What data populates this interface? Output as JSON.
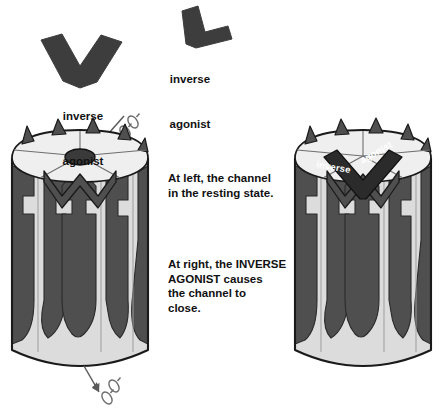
{
  "figure": {
    "background_color": "#ffffff"
  },
  "palette": {
    "molecule_dark": "#3d3d3d",
    "subunit_dark": "#4f4f4f",
    "channel_light": "#d8d8d8",
    "channel_top_light": "#ededed",
    "channel_pale": "#e9e9e9",
    "outline": "#000000",
    "text": "#111111",
    "label_text_on_dark": "#ffffff",
    "pore_dark": "#3a3a3a",
    "ion_outline": "#6b6b6b",
    "arrow": "#5a5a5a"
  },
  "molecules": [
    {
      "id": "inverse-agonist-v-shape",
      "label_line1": "inverse",
      "label_line2": "agonist",
      "shape": "wide-v-chevron",
      "color": "#3d3d3d"
    },
    {
      "id": "inverse-agonist-rotated",
      "label_line1": "inverse",
      "label_line2": "agonist",
      "shape": "rotated-v-boot",
      "color": "#3d3d3d"
    }
  ],
  "captions": [
    {
      "id": "caption-resting",
      "text": "At left, the channel\nin the resting state."
    },
    {
      "id": "caption-closing",
      "text": "At right, the INVERSE\nAGONIST causes\nthe channel to\nclose."
    }
  ],
  "channels": [
    {
      "id": "channel-left",
      "state": "resting",
      "state_description": "open pore, ions permeating",
      "pore_visible": true,
      "bound_ligand": null,
      "ion_flow": "downward through channel"
    },
    {
      "id": "channel-right",
      "state": "closed",
      "state_description": "inverse agonist bound at top, channel closed",
      "pore_visible": false,
      "bound_ligand": {
        "id": "bound-inverse-agonist",
        "label": "inverse agonist",
        "text_color": "#ffffff",
        "fill_color": "#2b2b2b"
      },
      "ion_flow": "none"
    }
  ],
  "ions": [
    {
      "id": "ion-top-1",
      "position": "above left channel"
    },
    {
      "id": "ion-top-2",
      "position": "above left channel"
    },
    {
      "id": "ion-bottom-1",
      "position": "below left channel"
    },
    {
      "id": "ion-bottom-2",
      "position": "below left channel"
    }
  ],
  "arrows": [
    {
      "id": "arrow-entry",
      "direction": "down-left",
      "position": "top of left channel"
    },
    {
      "id": "arrow-exit",
      "direction": "down-right",
      "position": "bottom of left channel"
    }
  ]
}
